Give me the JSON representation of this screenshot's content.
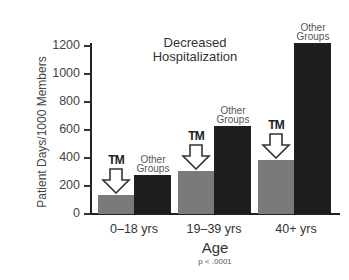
{
  "chart_data": {
    "type": "bar",
    "title": "Decreased Hospitalization",
    "xlabel": "Age",
    "ylabel": "Patient Days/1000 Members",
    "ylim": [
      0,
      1200
    ],
    "yticks": [
      0,
      200,
      400,
      600,
      800,
      1000,
      1200
    ],
    "grid": false,
    "legend": "inline labels above bars",
    "categories": [
      "0–18 yrs",
      "19–39 yrs",
      "40+ yrs"
    ],
    "series": [
      {
        "name": "TM",
        "color": "#7a7a7a",
        "values": [
          135,
          310,
          385
        ]
      },
      {
        "name": "Other Groups",
        "color": "#1e1e1e",
        "values": [
          280,
          630,
          1220
        ]
      }
    ],
    "annotations": [
      "p < .0001"
    ]
  },
  "labels": {
    "title_line1": "Decreased",
    "title_line2": "Hospitalization",
    "ylabel": "Patient Days/1000 Members",
    "xlabel": "Age",
    "pvalue": "p < .0001",
    "tm": "TM",
    "other_line1": "Other",
    "other_line2": "Groups",
    "yticks": [
      "1200",
      "1000",
      "800",
      "600",
      "400",
      "200",
      "0"
    ],
    "cat0": "0–18 yrs",
    "cat1": "19–39 yrs",
    "cat2": "40+ yrs"
  }
}
